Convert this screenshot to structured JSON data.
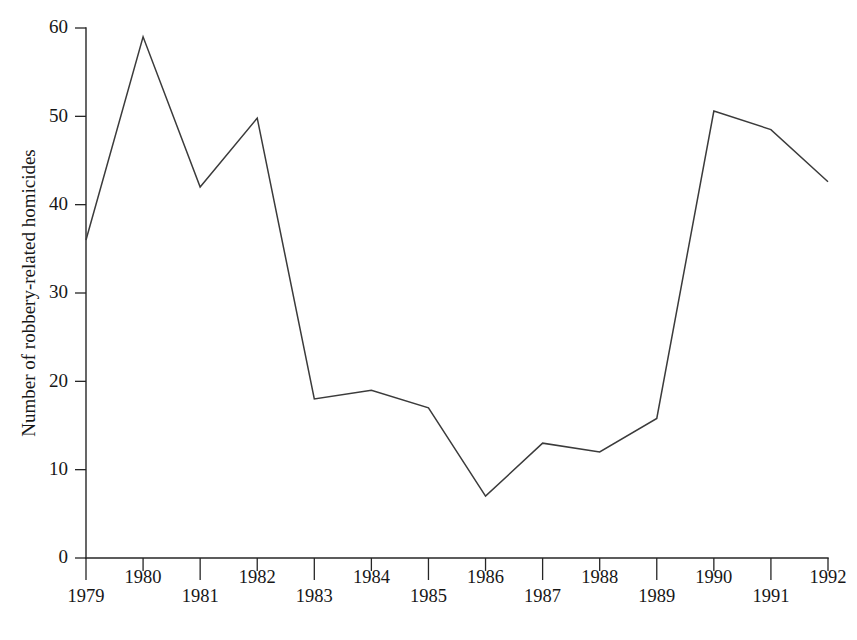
{
  "chart_data": {
    "type": "line",
    "title": "",
    "subtitle": "",
    "xlabel": "",
    "ylabel": "Number of robbery-related homicides",
    "categories": [
      "1979",
      "1980",
      "1981",
      "1982",
      "1983",
      "1984",
      "1985",
      "1986",
      "1987",
      "1988",
      "1989",
      "1990",
      "1991",
      "1992"
    ],
    "x": [
      1979,
      1980,
      1981,
      1982,
      1983,
      1984,
      1985,
      1986,
      1987,
      1988,
      1989,
      1990,
      1991,
      1992
    ],
    "values": [
      36,
      59,
      42,
      49.8,
      18,
      19,
      17,
      7,
      13,
      12,
      15.8,
      50.6,
      48.5,
      42.6
    ],
    "series": [
      {
        "name": "Robbery-related homicides",
        "values": [
          36,
          59,
          42,
          49.8,
          18,
          19,
          17,
          7,
          13,
          12,
          15.8,
          50.6,
          48.5,
          42.6
        ]
      }
    ],
    "ylim": [
      0,
      60
    ],
    "xlim": [
      1979,
      1992
    ],
    "yticks": [
      0,
      10,
      20,
      30,
      40,
      50,
      60
    ],
    "ytick_labels": [
      "0",
      "10",
      "20",
      "30",
      "40",
      "50",
      "60"
    ],
    "xticks": [
      1979,
      1980,
      1981,
      1982,
      1983,
      1984,
      1985,
      1986,
      1987,
      1988,
      1989,
      1990,
      1991,
      1992
    ],
    "xtick_labels": [
      "1979",
      "1980",
      "1981",
      "1982",
      "1983",
      "1984",
      "1985",
      "1986",
      "1987",
      "1988",
      "1989",
      "1990",
      "1991",
      "1992"
    ],
    "xtick_rows": [
      "lower",
      "upper",
      "lower",
      "upper",
      "lower",
      "upper",
      "lower",
      "upper",
      "lower",
      "upper",
      "lower",
      "upper",
      "lower",
      "upper"
    ],
    "grid": false,
    "legend": false,
    "legend_position": "none",
    "line_color": "#3b3b3b",
    "axis_color": "#262626",
    "background_color": "#ffffff"
  },
  "axis": {
    "y_title": "Number of robbery-related homicides"
  },
  "ticks": {
    "y": [
      {
        "label": "60"
      },
      {
        "label": "50"
      },
      {
        "label": "40"
      },
      {
        "label": "30"
      },
      {
        "label": "20"
      },
      {
        "label": "10"
      },
      {
        "label": "0"
      }
    ],
    "x": [
      {
        "label": "1979"
      },
      {
        "label": "1980"
      },
      {
        "label": "1981"
      },
      {
        "label": "1982"
      },
      {
        "label": "1983"
      },
      {
        "label": "1984"
      },
      {
        "label": "1985"
      },
      {
        "label": "1986"
      },
      {
        "label": "1987"
      },
      {
        "label": "1988"
      },
      {
        "label": "1989"
      },
      {
        "label": "1990"
      },
      {
        "label": "1991"
      },
      {
        "label": "1992"
      }
    ]
  }
}
